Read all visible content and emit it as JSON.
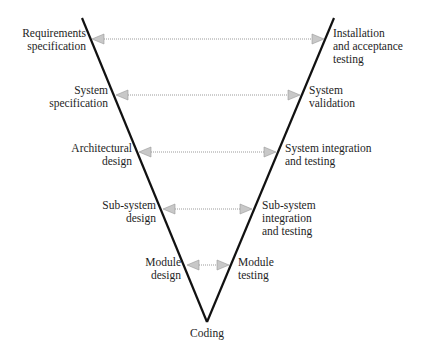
{
  "diagram": {
    "type": "V-model",
    "colors": {
      "line": "#111111",
      "arrow": "#9a9a9a",
      "text": "#1e1e1e"
    },
    "left_side": [
      {
        "lines": [
          "Requirements",
          "specification"
        ]
      },
      {
        "lines": [
          "System",
          "specification"
        ]
      },
      {
        "lines": [
          "Architectural",
          "design"
        ]
      },
      {
        "lines": [
          "Sub-system",
          "design"
        ]
      },
      {
        "lines": [
          "Module",
          "design"
        ]
      }
    ],
    "right_side": [
      {
        "lines": [
          "Installation",
          "and acceptance",
          "testing"
        ]
      },
      {
        "lines": [
          "System",
          "validation"
        ]
      },
      {
        "lines": [
          "System integration",
          "and testing"
        ]
      },
      {
        "lines": [
          "Sub-system",
          "integration",
          "and testing"
        ]
      },
      {
        "lines": [
          "Module",
          "testing"
        ]
      }
    ],
    "bottom": {
      "label": "Coding"
    },
    "connections": [
      {
        "from": "Requirements specification",
        "to": "Installation and acceptance testing"
      },
      {
        "from": "System specification",
        "to": "System validation"
      },
      {
        "from": "Architectural design",
        "to": "System integration and testing"
      },
      {
        "from": "Sub-system design",
        "to": "Sub-system integration and testing"
      },
      {
        "from": "Module design",
        "to": "Module testing"
      }
    ]
  }
}
